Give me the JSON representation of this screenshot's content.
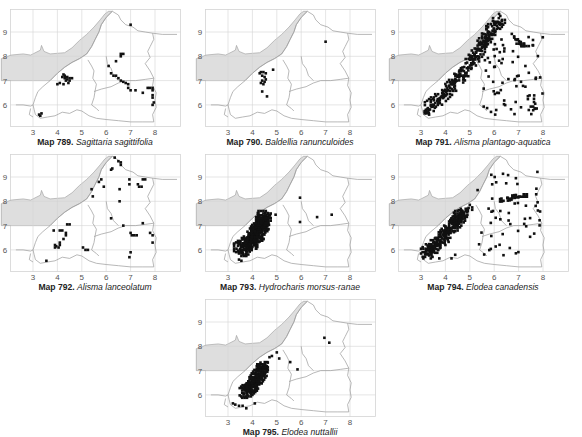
{
  "figure": {
    "grid": {
      "x_ticks": [
        "3",
        "4",
        "5",
        "6",
        "7",
        "8"
      ],
      "y_ticks": [
        "9",
        "8",
        "7",
        "6"
      ]
    },
    "colors": {
      "sea_fill": "#dedede",
      "outline": "#9a9a9a",
      "grid": "#d4d4d4",
      "record": "#111111"
    }
  },
  "maps": [
    {
      "id": "789",
      "label": "Map 789.",
      "species": "Sagittaria sagittifolia",
      "records": [
        [
          7.0,
          9.3
        ],
        [
          6.6,
          8.1
        ],
        [
          6.7,
          8.1
        ],
        [
          6.6,
          8.0
        ],
        [
          6.4,
          7.8
        ],
        [
          6.1,
          7.6
        ],
        [
          6.2,
          7.3
        ],
        [
          6.3,
          7.2
        ],
        [
          6.4,
          7.2
        ],
        [
          6.5,
          7.1
        ],
        [
          6.6,
          7.0
        ],
        [
          6.7,
          6.95
        ],
        [
          6.8,
          6.9
        ],
        [
          6.9,
          6.85
        ],
        [
          6.9,
          6.7
        ],
        [
          7.0,
          6.6
        ],
        [
          7.2,
          6.6
        ],
        [
          7.5,
          6.5
        ],
        [
          7.7,
          6.7
        ],
        [
          7.8,
          6.7
        ],
        [
          7.9,
          6.7
        ],
        [
          7.9,
          6.6
        ],
        [
          7.9,
          6.4
        ],
        [
          7.9,
          6.3
        ],
        [
          7.95,
          6.1
        ],
        [
          7.9,
          6.0
        ],
        [
          4.25,
          7.25
        ],
        [
          4.3,
          7.2
        ],
        [
          4.4,
          7.15
        ],
        [
          4.5,
          7.1
        ],
        [
          4.6,
          7.1
        ],
        [
          4.3,
          7.1
        ],
        [
          4.4,
          7.05
        ],
        [
          4.5,
          7.0
        ],
        [
          4.35,
          7.0
        ],
        [
          4.2,
          7.15
        ],
        [
          4.1,
          6.9
        ],
        [
          4.0,
          6.85
        ],
        [
          4.25,
          6.85
        ],
        [
          4.45,
          6.9
        ],
        [
          3.25,
          5.6
        ],
        [
          3.35,
          5.65
        ],
        [
          3.3,
          5.55
        ]
      ]
    },
    {
      "id": "790",
      "label": "Map 790.",
      "species": "Baldellia ranunculoides",
      "records": [
        [
          7.0,
          8.6
        ],
        [
          4.85,
          7.45
        ],
        [
          4.35,
          7.35
        ],
        [
          4.45,
          7.35
        ],
        [
          4.55,
          7.3
        ],
        [
          4.4,
          7.2
        ],
        [
          4.5,
          7.15
        ],
        [
          4.55,
          7.05
        ],
        [
          4.4,
          7.0
        ],
        [
          4.5,
          6.95
        ],
        [
          4.35,
          6.9
        ],
        [
          4.45,
          6.85
        ],
        [
          4.4,
          6.55
        ],
        [
          4.6,
          6.35
        ],
        [
          4.3,
          7.3
        ]
      ]
    },
    {
      "id": "791",
      "label": "Map 791.",
      "species": "Alisma plantago-aquatica",
      "records": "dense: ~300 records concentrated along the western lowland belt from 3.2,5.6 to 6.3,9.7, plus scattered records throughout the east"
    },
    {
      "id": "792",
      "label": "Map 792.",
      "species": "Alisma lanceolatum",
      "records": [
        [
          6.35,
          9.8
        ],
        [
          6.5,
          9.65
        ],
        [
          6.6,
          9.6
        ],
        [
          6.6,
          9.5
        ],
        [
          6.2,
          9.3
        ],
        [
          6.25,
          9.35
        ],
        [
          5.8,
          8.9
        ],
        [
          5.7,
          8.8
        ],
        [
          5.9,
          8.6
        ],
        [
          5.4,
          8.5
        ],
        [
          5.45,
          8.2
        ],
        [
          6.55,
          8.5
        ],
        [
          6.95,
          8.9
        ],
        [
          6.95,
          8.7
        ],
        [
          7.3,
          8.7
        ],
        [
          7.35,
          8.6
        ],
        [
          7.45,
          8.6
        ],
        [
          7.5,
          8.9
        ],
        [
          7.6,
          8.9
        ],
        [
          6.55,
          8.0
        ],
        [
          6.2,
          7.3
        ],
        [
          6.7,
          7.0
        ],
        [
          7.5,
          7.1
        ],
        [
          7.0,
          6.7
        ],
        [
          7.05,
          6.6
        ],
        [
          7.15,
          6.6
        ],
        [
          7.25,
          6.6
        ],
        [
          7.8,
          6.7
        ],
        [
          7.9,
          6.6
        ],
        [
          7.9,
          6.3
        ],
        [
          7.0,
          5.9
        ],
        [
          6.95,
          5.7
        ],
        [
          4.4,
          7.05
        ],
        [
          4.5,
          7.05
        ],
        [
          3.85,
          6.8
        ],
        [
          4.1,
          6.8
        ],
        [
          4.2,
          6.8
        ],
        [
          4.35,
          6.7
        ],
        [
          4.35,
          6.6
        ],
        [
          4.25,
          6.45
        ],
        [
          4.1,
          6.3
        ],
        [
          4.1,
          6.2
        ],
        [
          3.9,
          6.2
        ],
        [
          3.95,
          6.15
        ],
        [
          3.9,
          6.1
        ],
        [
          4.05,
          6.1
        ],
        [
          5.05,
          6.1
        ],
        [
          5.15,
          6.0
        ],
        [
          5.25,
          6.0
        ],
        [
          3.55,
          5.55
        ]
      ]
    },
    {
      "id": "793",
      "label": "Map 793.",
      "species": "Hydrocharis morsus-ranae",
      "records": "dense cluster ~100 records in western belt 3.4-4.6 x 5.9-7.5; scattered: [4.95,7.45],[5.95,8.15],[5.95,7.15],[6.65,7.35],[7.25,7.45],[3.25,6.25],[3.45,5.6],[3.55,5.55]"
    },
    {
      "id": "794",
      "label": "Map 794.",
      "species": "Elodea canadensis",
      "records": "~200 records: dense belt 3.1-5.0 x 5.8-7.7 and scattered in east, cluster around 6.3-7.3 x 8.0-8.4"
    },
    {
      "id": "795",
      "label": "Map 795.",
      "species": "Elodea nuttallii",
      "records": "dense cluster ~120 records 3.6-4.6 x 6.0-7.3; extras: [5.0,7.75],[5.1,7.5],[4.7,7.55],[5.55,7.35],[5.85,7.05],[6.95,8.35],[7.15,8.15],[3.2,5.65],[3.3,5.6],[3.45,5.55],[3.6,5.55],[3.75,5.45],[4.1,5.65]"
    }
  ]
}
